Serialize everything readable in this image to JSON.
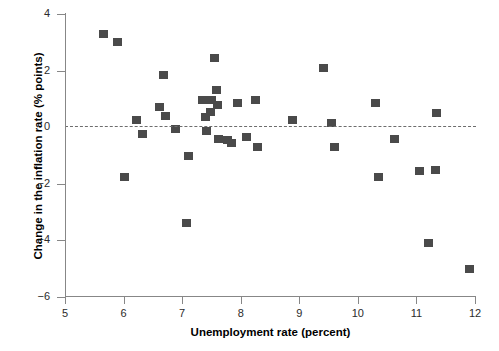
{
  "chart_data": {
    "type": "scatter",
    "title": "",
    "xlabel": "Unemployment rate (percent)",
    "ylabel": "Change in the inflation rate (% points)",
    "xlim": [
      5,
      12
    ],
    "ylim": [
      -6,
      4
    ],
    "xticks": [
      5,
      6,
      7,
      8,
      9,
      10,
      11,
      12
    ],
    "xtick_labels": [
      "5",
      "6",
      "7",
      "8",
      "9",
      "10",
      "11",
      "12"
    ],
    "yticks": [
      4,
      2,
      0,
      -2,
      -4,
      -6
    ],
    "ytick_labels": [
      "4",
      "2",
      "0",
      "−2",
      "−4",
      "−6"
    ],
    "grid": false,
    "legend": null,
    "reference_line": {
      "orientation": "horizontal",
      "y": 0,
      "style": "dashed",
      "color": "#6d6d6d"
    },
    "marker": {
      "shape": "square",
      "color": "#4a4a4a",
      "size": 9
    },
    "points": [
      {
        "x": 5.66,
        "y": 3.3
      },
      {
        "x": 5.9,
        "y": 3.0
      },
      {
        "x": 6.22,
        "y": 0.25
      },
      {
        "x": 6.02,
        "y": -1.75
      },
      {
        "x": 6.33,
        "y": -0.25
      },
      {
        "x": 6.68,
        "y": 1.85
      },
      {
        "x": 6.62,
        "y": 0.72
      },
      {
        "x": 6.72,
        "y": 0.38
      },
      {
        "x": 6.88,
        "y": -0.05
      },
      {
        "x": 7.1,
        "y": -1.0
      },
      {
        "x": 7.08,
        "y": -3.4
      },
      {
        "x": 7.35,
        "y": 0.95
      },
      {
        "x": 7.4,
        "y": 0.35
      },
      {
        "x": 7.55,
        "y": 2.45
      },
      {
        "x": 7.58,
        "y": 1.3
      },
      {
        "x": 7.5,
        "y": 0.95
      },
      {
        "x": 7.6,
        "y": 0.8
      },
      {
        "x": 7.48,
        "y": 0.55
      },
      {
        "x": 7.42,
        "y": -0.15
      },
      {
        "x": 7.62,
        "y": -0.42
      },
      {
        "x": 7.78,
        "y": -0.45
      },
      {
        "x": 7.85,
        "y": -0.55
      },
      {
        "x": 7.95,
        "y": 0.85
      },
      {
        "x": 8.1,
        "y": -0.35
      },
      {
        "x": 8.25,
        "y": 0.95
      },
      {
        "x": 8.28,
        "y": -0.7
      },
      {
        "x": 8.88,
        "y": 0.25
      },
      {
        "x": 9.42,
        "y": 2.1
      },
      {
        "x": 9.55,
        "y": 0.15
      },
      {
        "x": 9.6,
        "y": -0.7
      },
      {
        "x": 10.3,
        "y": 0.85
      },
      {
        "x": 10.35,
        "y": -1.75
      },
      {
        "x": 10.62,
        "y": -0.4
      },
      {
        "x": 11.05,
        "y": -1.55
      },
      {
        "x": 11.2,
        "y": -4.1
      },
      {
        "x": 11.32,
        "y": -1.5
      },
      {
        "x": 11.35,
        "y": 0.5
      },
      {
        "x": 11.9,
        "y": -5.0
      }
    ]
  }
}
